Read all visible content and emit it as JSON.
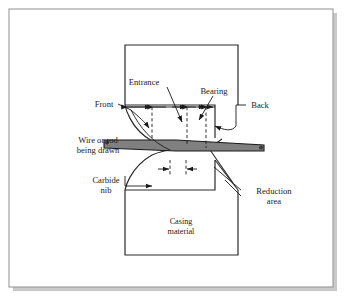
{
  "figure": {
    "type": "cross-section-diagram",
    "frame": {
      "border_color": "#9a9a9a",
      "shadow_color": "#c9c9c9",
      "background": "#ffffff"
    },
    "colors": {
      "outline": "#2b2b2b",
      "wire_fill": "#808080",
      "wire_stroke": "#1a1a1a",
      "dimension_line": "#1a1a1a",
      "dashed_line": "#1a1a1a",
      "leader_line": "#1a1a1a"
    },
    "labels": {
      "entrance": "Entrance",
      "bearing": "Bearing",
      "front": "Front",
      "back": "Back",
      "wire_line1": "Wire or rod",
      "wire_line2": "being drawn",
      "carbide_line1": "Carbide",
      "carbide_line2": "nib",
      "reduction_line1": "Reduction",
      "reduction_line2": "area",
      "casing_line1": "Casing",
      "casing_line2": "material"
    },
    "parts": [
      {
        "name": "casing-material",
        "label": "Casing material"
      },
      {
        "name": "carbide-nib",
        "label": "Carbide nib"
      },
      {
        "name": "wire-or-rod",
        "label": "Wire or rod being drawn"
      },
      {
        "name": "entrance-zone",
        "label": "Entrance"
      },
      {
        "name": "bearing-zone",
        "label": "Bearing"
      },
      {
        "name": "reduction-area",
        "label": "Reduction area"
      },
      {
        "name": "front-side",
        "label": "Front"
      },
      {
        "name": "back-side",
        "label": "Back"
      }
    ]
  }
}
